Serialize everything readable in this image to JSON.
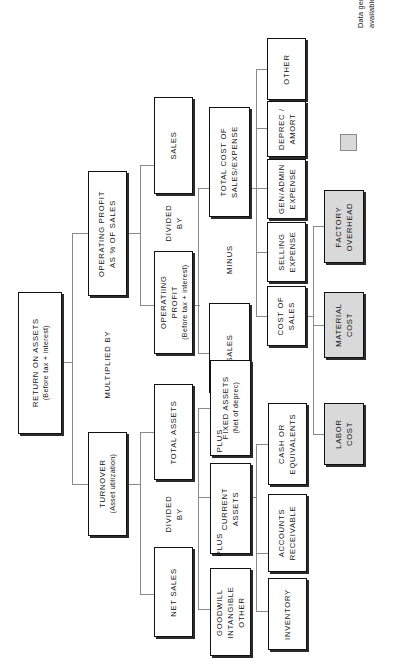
{
  "diagram": {
    "orientation": "rotated-90",
    "colors": {
      "box_fill": "#ffffff",
      "shaded_fill": "#d9d9d9",
      "border": "#111111",
      "connector": "#8a8a8a",
      "text": "#111111"
    },
    "nodes": [
      {
        "id": "roa",
        "line1": "RETURN ON ASSETS",
        "line2": "(Before tax + interest)",
        "shaded": false
      },
      {
        "id": "op_pct",
        "line1": "OPERATING PROFIT",
        "line2": "AS % OF SALES",
        "shaded": false
      },
      {
        "id": "turnover",
        "line1": "TURNOVER",
        "line2": "(Asset utilization)",
        "shaded": false
      },
      {
        "id": "sales_1",
        "line1": "SALES",
        "line2": "",
        "shaded": false
      },
      {
        "id": "op_profit",
        "line1": "OPERATIING",
        "line2": "PROFIT",
        "line3": "(Before tax + interest)",
        "shaded": false
      },
      {
        "id": "total_assets",
        "line1": "TOTAL ASSETS",
        "line2": "",
        "shaded": false
      },
      {
        "id": "net_sales",
        "line1": "NET SALES",
        "line2": "",
        "shaded": false
      },
      {
        "id": "total_cost",
        "line1": "TOTAL COST OF",
        "line2": "SALES/EXPENSE",
        "shaded": false
      },
      {
        "id": "sales_2",
        "line1": "SALES",
        "line2": "",
        "shaded": false
      },
      {
        "id": "fixed",
        "line1": "FIXED ASSETS",
        "line2": "(Net of deprec)",
        "shaded": false
      },
      {
        "id": "current",
        "line1": "CURRENT",
        "line2": "ASSETS",
        "shaded": false
      },
      {
        "id": "goodwill",
        "line1": "GOODWILL",
        "line2": "INTANGIBLE",
        "line3": "OTHER",
        "shaded": false
      },
      {
        "id": "other",
        "line1": "OTHER",
        "line2": "",
        "shaded": false
      },
      {
        "id": "deprec",
        "line1": "DEPREC /",
        "line2": "AMORT",
        "shaded": false
      },
      {
        "id": "genadmin",
        "line1": "GEN/ADMIN",
        "line2": "EXPENSE",
        "shaded": false
      },
      {
        "id": "selling",
        "line1": "SELLING",
        "line2": "EXPENSE",
        "shaded": false
      },
      {
        "id": "cost_sales",
        "line1": "COST OF",
        "line2": "SALES",
        "shaded": false
      },
      {
        "id": "cash",
        "line1": "CASH OR",
        "line2": "EQUIVALENTS",
        "shaded": false
      },
      {
        "id": "ar",
        "line1": "ACCOUNTS",
        "line2": "RECEIVABLE",
        "shaded": false
      },
      {
        "id": "inventory",
        "line1": "INVENTORY",
        "line2": "",
        "shaded": false
      },
      {
        "id": "factory",
        "line1": "FACTORY",
        "line2": "OVERHEAD",
        "shaded": true
      },
      {
        "id": "material",
        "line1": "MATERIAL",
        "line2": "COST",
        "shaded": true
      },
      {
        "id": "labor",
        "line1": "LABOR",
        "line2": "COST",
        "shaded": true
      }
    ],
    "operators": [
      {
        "id": "multiplied_by",
        "line1": "MULTIPLIED BY",
        "line2": ""
      },
      {
        "id": "divided_by_1",
        "line1": "DIVIDED",
        "line2": "BY"
      },
      {
        "id": "divided_by_2",
        "line1": "DIVIDED",
        "line2": "BY"
      },
      {
        "id": "minus",
        "line1": "MINUS",
        "line2": ""
      },
      {
        "id": "plus_1",
        "line1": "PLUS",
        "line2": ""
      },
      {
        "id": "plus_2",
        "line1": "PLUS",
        "line2": ""
      }
    ]
  },
  "legend": {
    "swatch_color": "#d9d9d9",
    "line1": "Data generally not",
    "line2": "available in 10-K report"
  }
}
